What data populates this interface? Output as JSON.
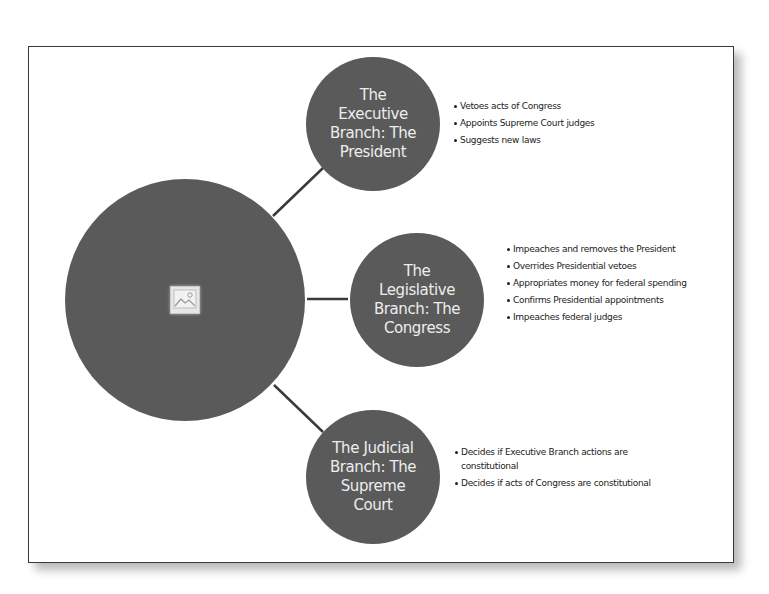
{
  "diagram": {
    "type": "hub-and-spoke",
    "hub": {
      "label": "",
      "icon": "image-placeholder-icon"
    },
    "branches": [
      {
        "title": "The Executive Branch: The President",
        "title_lines": "The\nExecutive\nBranch: The\nPresident",
        "powers": [
          "Vetoes acts of Congress",
          "Appoints Supreme Court judges",
          "Suggests new laws"
        ]
      },
      {
        "title": "The Legislative Branch: The Congress",
        "title_lines": "The\nLegislative\nBranch: The\nCongress",
        "powers": [
          "Impeaches and removes the President",
          "Overrides Presidential vetoes",
          "Appropriates money for federal spending",
          "Confirms Presidential appointments",
          "Impeaches federal judges"
        ]
      },
      {
        "title": "The Judicial Branch: The Supreme Court",
        "title_lines": "The Judicial\nBranch: The\nSupreme\nCourt",
        "powers": [
          "Decides if Executive Branch actions are constitutional",
          "Decides if acts of Congress are constitutional"
        ]
      }
    ],
    "colors": {
      "circle_fill": "#5a5a5a",
      "circle_text": "#ededed",
      "connector": "#3a3a3a",
      "frame_border": "#3a3a3a"
    }
  }
}
